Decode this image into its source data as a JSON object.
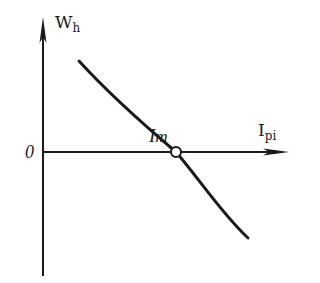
{
  "diagram": {
    "y_axis": {
      "label_main": "W",
      "label_sub": "h"
    },
    "x_axis": {
      "label_main": "I",
      "label_sub": "pi"
    },
    "origin_label": "0",
    "point": {
      "label_main": "I",
      "label_sub": "m"
    },
    "colors": {
      "line": "#1a1a1a",
      "background": "#ffffff"
    }
  }
}
